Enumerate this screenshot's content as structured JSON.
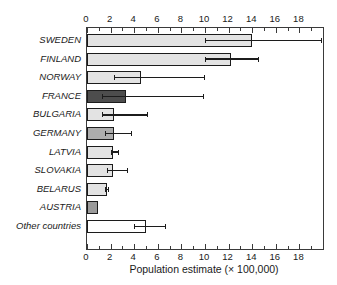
{
  "chart_data": {
    "type": "bar",
    "orientation": "horizontal",
    "title": "",
    "xlabel": "Population estimate (× 100,000)",
    "ylabel": "",
    "categories": [
      "SWEDEN",
      "FINLAND",
      "NORWAY",
      "FRANCE",
      "BULGARIA",
      "GERMANY",
      "LATVIA",
      "SLOVAKIA",
      "BELARUS",
      "AUSTRIA",
      "Other countries"
    ],
    "values": [
      14.0,
      12.2,
      4.6,
      3.3,
      2.3,
      2.3,
      2.2,
      2.2,
      1.7,
      0.9,
      5.0
    ],
    "error_low": [
      10.0,
      10.0,
      2.3,
      1.3,
      1.3,
      1.5,
      2.0,
      1.7,
      1.5,
      null,
      4.0
    ],
    "error_high": [
      19.9,
      14.6,
      10.0,
      9.9,
      5.2,
      3.8,
      2.7,
      3.5,
      1.9,
      null,
      6.7
    ],
    "bar_colors": [
      "#e3e3e3",
      "#e3e3e3",
      "#e3e3e3",
      "#4d4d4d",
      "#e3e3e3",
      "#adadad",
      "#e3e3e3",
      "#e3e3e3",
      "#e3e3e3",
      "#9b9b9b",
      "#ffffff"
    ],
    "xlim": [
      0,
      20
    ],
    "xticks_labeled": [
      0,
      2,
      4,
      6,
      8,
      10,
      12,
      14,
      16,
      18
    ],
    "xticks_minor": [
      1,
      3,
      5,
      7,
      9,
      11,
      13,
      15,
      17,
      19
    ],
    "axes_with_ticks": [
      "top",
      "bottom"
    ],
    "grid": false,
    "legend": false
  },
  "colors": {
    "background": "#ffffff",
    "axis": "#3a3a3a",
    "bar_border": "#1c1c1c",
    "error_bar": "#1c1c1c",
    "light_bar": "#e3e3e3",
    "dark_bar": "#4d4d4d",
    "medium_bar": "#adadad",
    "white_bar": "#ffffff"
  }
}
